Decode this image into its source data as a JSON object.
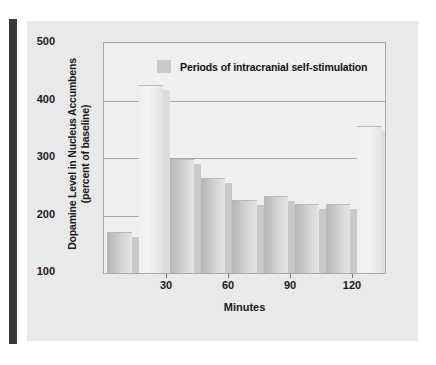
{
  "figure": {
    "panel_color": "#e9e9e9",
    "rule_color": "#3a3a3a"
  },
  "legend": {
    "swatch_name": "legend-swatch",
    "label": "Periods of intracranial self-stimulation",
    "swatch_color": "#c9c9c9"
  },
  "axes": {
    "y_title_line1": "Dopamine Level in Nucleus Accumbens",
    "y_title_line2": "(percent of baseline)",
    "x_title": "Minutes",
    "y_ticks": [
      "500",
      "400",
      "300",
      "200",
      "100"
    ],
    "x_ticks": [
      "30",
      "60",
      "90",
      "120"
    ]
  },
  "chart_data": {
    "type": "bar",
    "title": "",
    "subtitle": "",
    "xlabel": "Minutes",
    "ylabel": "Dopamine Level in Nucleus Accumbens (percent of baseline)",
    "ylim": [
      0,
      500
    ],
    "yticks": [
      100,
      200,
      300,
      400,
      500
    ],
    "xticks": [
      30,
      60,
      90,
      120
    ],
    "grid": true,
    "legend": [
      "Periods of intracranial self-stimulation"
    ],
    "legend_position": "inside-top-center",
    "categories": [
      "0-15",
      "15-30",
      "30-45",
      "45-60",
      "60-75",
      "75-90",
      "90-105",
      "105-120",
      "120-135"
    ],
    "x": [
      7.5,
      22.5,
      37.5,
      52.5,
      67.5,
      82.5,
      97.5,
      112.5,
      127.5
    ],
    "values": [
      90,
      408,
      248,
      207,
      158,
      168,
      149,
      150,
      320
    ],
    "series": [
      {
        "name": "Dopamine level (percent of baseline)",
        "values": [
          90,
          408,
          248,
          207,
          158,
          168,
          149,
          150,
          320
        ]
      }
    ],
    "bar_styles": [
      "dark",
      "light",
      "dark",
      "dark",
      "dark",
      "dark",
      "dark",
      "dark",
      "light"
    ],
    "stimulation_periods": [
      false,
      true,
      false,
      false,
      false,
      false,
      false,
      false,
      true
    ]
  }
}
